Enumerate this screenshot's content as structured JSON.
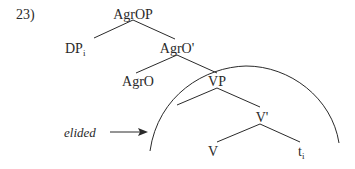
{
  "example_number": "23)",
  "tree": {
    "root": "AgrOP",
    "specifier": {
      "label": "DP",
      "subscript": "i"
    },
    "agro_bar": "AgrO'",
    "agro_head": "AgrO",
    "vp": "VP",
    "v_bar": "V'",
    "v_head": "V",
    "trace": {
      "label": "t",
      "subscript": "i"
    }
  },
  "annotation": {
    "label": "elided",
    "arrow": "right-arrow"
  },
  "colors": {
    "ink": "#2a2a2a",
    "background": "#ffffff"
  }
}
